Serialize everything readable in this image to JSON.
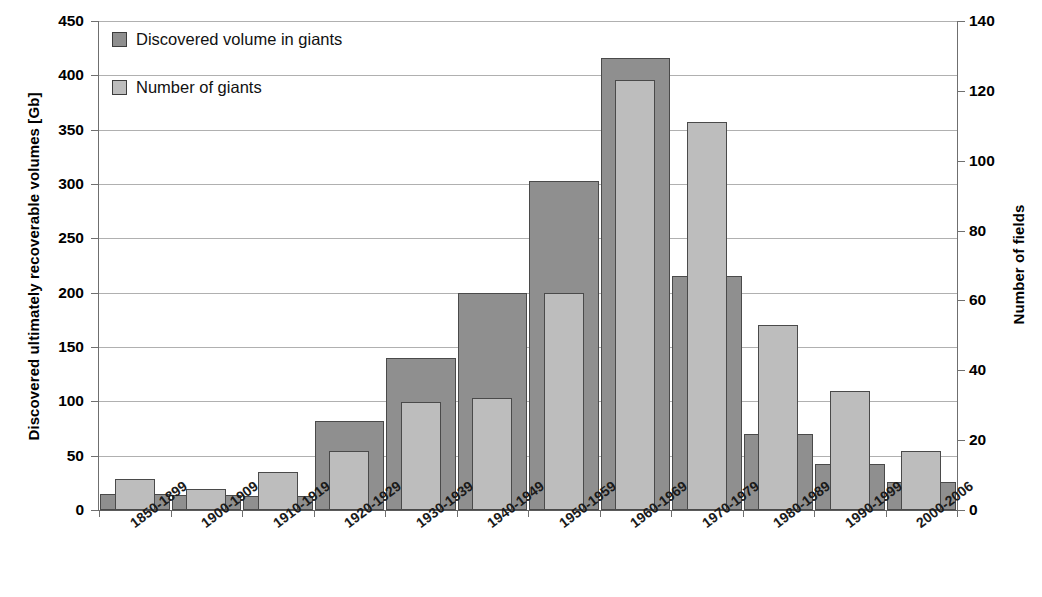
{
  "chart_data": {
    "type": "bar",
    "title": "",
    "subtitle": "",
    "xlabel": "",
    "ylabel": "Discovered ultimately recoverable volumes [Gb]",
    "y2label": "Number of fields",
    "grid": true,
    "legend_position": "top-left",
    "categories": [
      "1850-1899",
      "1900-1909",
      "1910-1919",
      "1920-1929",
      "1930-1939",
      "1940-1949",
      "1950-1959",
      "1960-1969",
      "1970-1979",
      "1980-1989",
      "1990-1999",
      "2000-2006"
    ],
    "series": [
      {
        "name": "Discovered volume in giants",
        "axis": "left",
        "unit": "Gb",
        "color": "#8f8f8f",
        "values": [
          15,
          14,
          13,
          82,
          140,
          200,
          303,
          416,
          215,
          70,
          42,
          26
        ]
      },
      {
        "name": "Number of giants",
        "axis": "right",
        "unit": "fields",
        "color": "#bdbdbd",
        "values": [
          9,
          6,
          11,
          17,
          31,
          32,
          62,
          123,
          111,
          53,
          34,
          17
        ]
      }
    ],
    "yaxis_left": {
      "label": "Discovered ultimately recoverable volumes [Gb]",
      "min": 0,
      "max": 450,
      "step": 50,
      "ticks": [
        450,
        400,
        350,
        300,
        250,
        200,
        150,
        100,
        50,
        0
      ]
    },
    "yaxis_right": {
      "label": "Number of fields",
      "min": 0,
      "max": 140,
      "step": 20,
      "ticks": [
        140,
        120,
        100,
        80,
        60,
        40,
        20,
        0
      ]
    },
    "legend": [
      {
        "label": "Discovered volume in giants",
        "swatch": "#8f8f8f"
      },
      {
        "label": "Number of giants",
        "swatch": "#bdbdbd"
      }
    ]
  }
}
